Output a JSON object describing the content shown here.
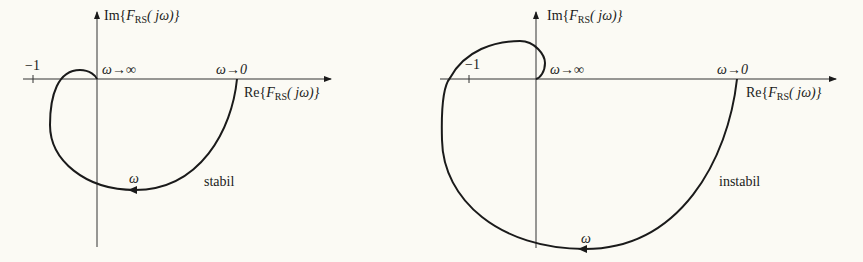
{
  "figure": {
    "left": {
      "title": "stabil",
      "im_axis_label": {
        "prefix": "Im{",
        "F": "F",
        "sub": "RS",
        "arg": "( jω)}"
      },
      "re_axis_label": {
        "prefix": "Re{",
        "F": "F",
        "sub": "RS",
        "arg": "( jω)}"
      },
      "minus_one": "−1",
      "omega_inf": "ω→∞",
      "omega_zero": "ω→0",
      "omega": "ω",
      "status": "stabil"
    },
    "right": {
      "im_axis_label": {
        "prefix": "Im{",
        "F": "F",
        "sub": "RS",
        "arg": "( jω)}"
      },
      "re_axis_label": {
        "prefix": "Re{",
        "F": "F",
        "sub": "RS",
        "arg": "( jω)}"
      },
      "minus_one": "−1",
      "omega_inf": "ω→∞",
      "omega_zero": "ω→0",
      "omega": "ω",
      "status": "instabil"
    }
  },
  "colors": {
    "background": "#fbfaf4",
    "ink": "#1a1a1a"
  }
}
